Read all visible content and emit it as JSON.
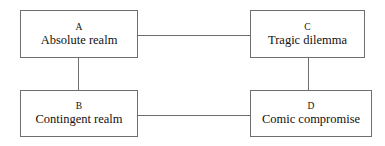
{
  "diagram": {
    "type": "node-link-diagram",
    "background_color": "#ffffff",
    "line_color": "#6e6e6e",
    "text_color": "#111111",
    "nodes": [
      {
        "id": "A",
        "key": "A",
        "label": "Absolute realm"
      },
      {
        "id": "C",
        "key": "C",
        "label": "Tragic dilemma"
      },
      {
        "id": "B",
        "key": "B",
        "label": "Contingent realm"
      },
      {
        "id": "D",
        "key": "D",
        "label": "Comic compromise"
      }
    ],
    "edges": [
      {
        "from": "A",
        "to": "C",
        "orientation": "horizontal"
      },
      {
        "from": "B",
        "to": "D",
        "orientation": "horizontal"
      },
      {
        "from": "A",
        "to": "B",
        "orientation": "vertical"
      },
      {
        "from": "C",
        "to": "D",
        "orientation": "vertical"
      }
    ]
  }
}
